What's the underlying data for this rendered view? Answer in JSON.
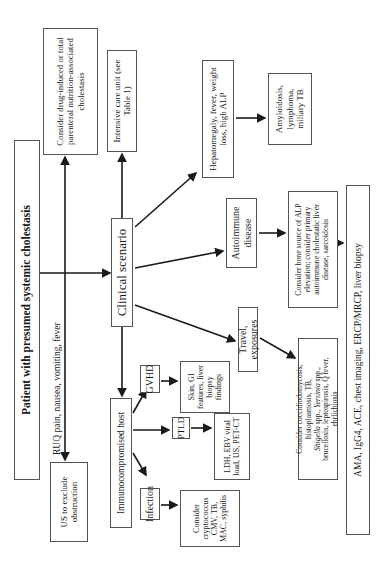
{
  "title": "Patient with presumed systemic cholestasis",
  "ruq_label": "RUQ pain, nausea, vomiting, fever",
  "us_box": "US to exclude obstruction",
  "drug_box": "Consider drug-induced or total parenteral nutrition-associated cholestasis",
  "clinical_scenario": "Clinical scenario",
  "icu_box": "Intensive care unit (see Table 1)",
  "immuno_box": "Immunocompromised host",
  "hepatomegaly_box": "Hepatomegaly, fever, weight loss, high ALP",
  "amyloid_box": "Amyloidosis, lymphoma, miliary TB",
  "autoimmune_box": "Autoimmune disease",
  "bone_box": "Consider bone source of ALP elevation; consider primary autoimmune cholestatic liver disease, sarcoidosis",
  "travel_box": "Travel, exposures",
  "cocci_box": {
    "line1": "Consider coccidiodomycosis, histoplasmosis, TB,",
    "shigella": "Shigella",
    "spp1": " spp., ",
    "yersinia": "Yersinia",
    "spp2": " spp.,",
    "line3": "brucellosis, leptospirosis, Q fever, ehrlichiosis"
  },
  "workup_bar": "AMA, IgG4, ACE, chest imaging, ERCP/MRCP, liver biopsy",
  "gvhd_box": "GVHD",
  "gvhd_findings": "Skin, GI features, liver biopsy findings",
  "ptld_box": "PTLD",
  "ptld_findings": "LDH, EBV viral load, US, PET-CT",
  "infection_box": "Infection",
  "infection_findings": "Consider cryptococcus CMV, TB, MAC, syphilis"
}
